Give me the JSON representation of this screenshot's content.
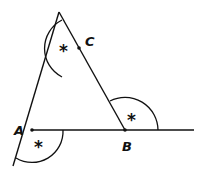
{
  "diagram": {
    "type": "geometry-triangle-exterior-angles",
    "points": [
      {
        "name": "A",
        "label": "A",
        "x": 32,
        "y": 130
      },
      {
        "name": "B",
        "label": "B",
        "x": 125,
        "y": 130
      },
      {
        "name": "C",
        "label": "C",
        "x": 79,
        "y": 48
      }
    ],
    "angle_marks": [
      {
        "at": "A",
        "symbol": "*"
      },
      {
        "at": "B",
        "symbol": "*"
      },
      {
        "at": "C",
        "symbol": "*"
      }
    ],
    "stroke_color": "#111111"
  }
}
